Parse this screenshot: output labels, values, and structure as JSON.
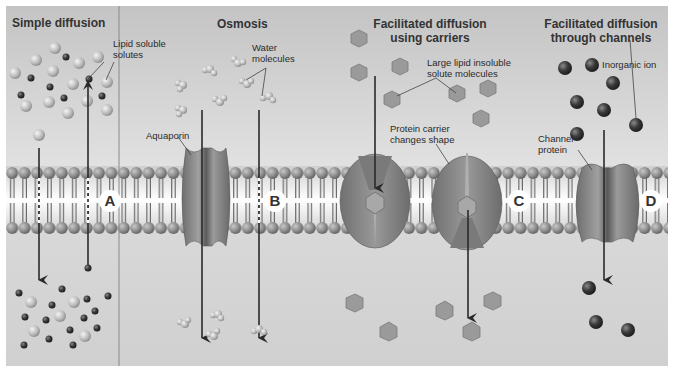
{
  "figure": {
    "type": "membrane transport diagram",
    "colors": {
      "extracellular_bg": "#cfcfcf",
      "intracellular_bg": "#d3d3d3",
      "phospholipid_head": "#8a8a8a",
      "protein": "#8c8c8c",
      "hexagon_solute": "#9a9a9a",
      "dark_ion": "#3a3a3a",
      "arrow": "#2a2a2a",
      "letter_badge_bg": "#ffffff"
    }
  },
  "panels": [
    {
      "id": "A",
      "title": "Simple diffusion",
      "letter": "A",
      "labels": [
        "Lipid soluble",
        "solutes"
      ]
    },
    {
      "id": "B",
      "title": "Osmosis",
      "letter": "B",
      "labels": [
        "Water",
        "molecules"
      ],
      "protein_label": "Aquaporin"
    },
    {
      "id": "C",
      "title_line1": "Facilitated diffusion",
      "title_line2": "using carriers",
      "letter": "C",
      "labels": [
        "Large lipid insoluble",
        "solute molecules"
      ],
      "protein_label": [
        "Protein carrier",
        "changes shape"
      ]
    },
    {
      "id": "D",
      "title_line1": "Facilitated diffusion",
      "title_line2": "through channels",
      "letter": "D",
      "labels": [
        "Inorganic ion"
      ],
      "protein_label": [
        "Channel",
        "protein"
      ]
    }
  ]
}
